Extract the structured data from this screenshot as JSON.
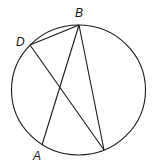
{
  "diagram": {
    "type": "inscribed-chords",
    "points": [
      {
        "id": "B",
        "label": "B"
      },
      {
        "id": "D",
        "label": "D"
      },
      {
        "id": "A",
        "label": "A"
      },
      {
        "id": "E",
        "label": ""
      }
    ],
    "segments": [
      {
        "from": "D",
        "to": "B"
      },
      {
        "from": "B",
        "to": "A"
      },
      {
        "from": "B",
        "to": "E"
      },
      {
        "from": "D",
        "to": "E"
      }
    ],
    "stroke_color": "#1a1a1a",
    "background_color": "#ffffff"
  }
}
